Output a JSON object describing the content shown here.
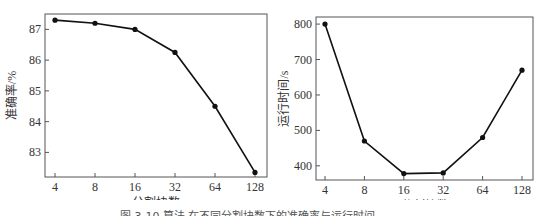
{
  "chart_data": [
    {
      "type": "line",
      "title": "",
      "xlabel": "分割块数",
      "ylabel": "准确率/%",
      "categories": [
        "4",
        "8",
        "16",
        "32",
        "64",
        "128"
      ],
      "values": [
        87.3,
        87.2,
        87.0,
        86.25,
        84.5,
        82.35
      ],
      "yticks": [
        83,
        84,
        85,
        86,
        87
      ],
      "ylim": [
        82.2,
        87.5
      ],
      "grid": false,
      "marker": "circle",
      "color": "#111111"
    },
    {
      "type": "line",
      "title": "",
      "xlabel": "分割块数",
      "ylabel": "运行时间/s",
      "categories": [
        "4",
        "8",
        "16",
        "32",
        "64",
        "128"
      ],
      "values": [
        800,
        470,
        378,
        380,
        480,
        670
      ],
      "yticks": [
        400,
        500,
        600,
        700,
        800
      ],
      "ylim": [
        360,
        820
      ],
      "grid": false,
      "marker": "circle",
      "color": "#111111"
    }
  ],
  "caption": "图 3-10   算法 在不同分割块数下的准确率与运行时间"
}
